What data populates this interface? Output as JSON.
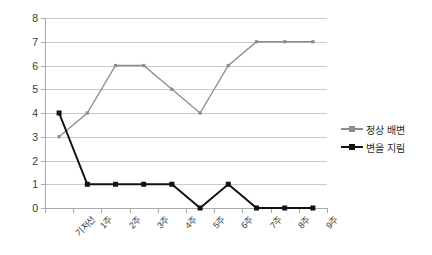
{
  "chart_data": {
    "type": "line",
    "title": "",
    "xlabel": "",
    "ylabel": "",
    "ylim": [
      0,
      8
    ],
    "ytick_step": 1,
    "grid": true,
    "legend_position": "right",
    "categories": [
      "기저선",
      "1주",
      "2주",
      "3주",
      "4주",
      "5주",
      "6주",
      "7주",
      "8주",
      "9주"
    ],
    "ytick_labels": [
      "8",
      "7",
      "6",
      "5",
      "4",
      "3",
      "2",
      "1",
      "0"
    ],
    "ytick_values": [
      8,
      7,
      6,
      5,
      4,
      3,
      2,
      1,
      0
    ],
    "series": [
      {
        "name": "정상 배변",
        "color": "#8c8c8c",
        "marker": "small-square",
        "values": [
          3,
          4,
          6,
          6,
          5,
          4,
          6,
          7,
          7,
          7
        ]
      },
      {
        "name": "변을 지림",
        "color": "#111111",
        "marker": "square",
        "values": [
          4,
          1,
          1,
          1,
          1,
          0,
          1,
          0,
          0,
          0
        ]
      }
    ]
  },
  "legend": {
    "items": [
      {
        "label": "정상 배변"
      },
      {
        "label": "변을 지림"
      }
    ]
  },
  "colors": {
    "series_normal": "#8c8c8c",
    "series_soiling": "#111111",
    "gridline": "#c9c9c9",
    "axis": "#a8a8a8",
    "text": "#3a3a3a",
    "background": "#ffffff"
  }
}
